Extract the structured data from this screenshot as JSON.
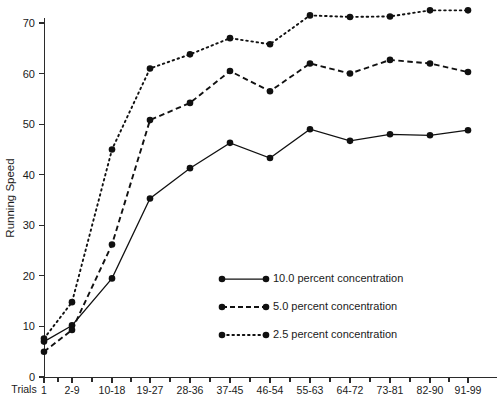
{
  "chart_data": {
    "type": "line",
    "title": "",
    "xlabel": "Trials",
    "ylabel": "Running Speed",
    "categories": [
      "1",
      "2-9",
      "10-18",
      "19-27",
      "28-36",
      "37-45",
      "46-54",
      "55-63",
      "64-72",
      "73-81",
      "82-90",
      "91-99"
    ],
    "ylim": [
      0,
      74
    ],
    "yticks": [
      0,
      10,
      20,
      30,
      40,
      50,
      60,
      70
    ],
    "ytick_labels": [
      "0",
      "10",
      "20",
      "30",
      "40",
      "50",
      "60",
      "70"
    ],
    "grid": false,
    "legend_position": "center-right",
    "series": [
      {
        "name": "10.0 percent concentration",
        "style": "solid",
        "values": [
          7.0,
          10.2,
          19.5,
          35.3,
          41.3,
          46.3,
          43.3,
          49.0,
          46.7,
          48.0,
          47.8,
          48.8
        ]
      },
      {
        "name": "5.0 percent concentration",
        "style": "dashed",
        "values": [
          5.0,
          9.3,
          26.2,
          50.8,
          54.2,
          60.5,
          56.5,
          62.0,
          60.0,
          62.7,
          62.0,
          60.3
        ]
      },
      {
        "name": "2.5 percent concentration",
        "style": "dotted",
        "values": [
          7.6,
          14.8,
          45.0,
          61.0,
          63.8,
          67.0,
          65.8,
          71.5,
          71.2,
          71.3,
          72.5,
          72.5
        ]
      }
    ]
  },
  "axes": {
    "y_title": "Running Speed",
    "x_title": "Trials"
  },
  "legend": {
    "items": [
      {
        "label": "10.0 percent concentration",
        "style": "solid"
      },
      {
        "label": "5.0 percent concentration",
        "style": "dashed"
      },
      {
        "label": "2.5 percent concentration",
        "style": "dotted"
      }
    ]
  },
  "colors": {
    "ink": "#111111",
    "background": "#ffffff"
  }
}
